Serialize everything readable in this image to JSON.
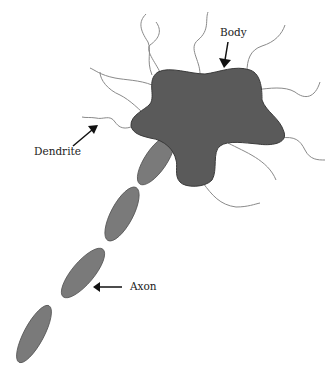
{
  "diagram": {
    "colors": {
      "background": "#ffffff",
      "body_fill": "#5a5a5a",
      "body_stroke": "#3a3a3a",
      "axon_fill": "#7a7a7a",
      "axon_stroke": "#555555",
      "dendrite_stroke": "#8a8a8a",
      "arrow": "#111111",
      "label": "#222222"
    },
    "labels": {
      "body": "Body",
      "dendrite": "Dendrite",
      "axon": "Axon"
    },
    "parts": [
      "cell-body",
      "dendrites",
      "axon-segments"
    ]
  }
}
